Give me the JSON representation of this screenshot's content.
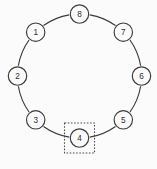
{
  "diagram": {
    "type": "ring-network",
    "background_color": "#fbfbfb",
    "line_color": "#3a3a3a",
    "ring": {
      "center_x": 79.5,
      "center_y": 76,
      "radius": 62,
      "node_radius": 9.2,
      "gap_degrees": 9.5
    },
    "nodes": [
      {
        "id": "node-1",
        "label": "1",
        "angle": 225,
        "cx": 35.7,
        "cy": 32.2,
        "selected": false
      },
      {
        "id": "node-2",
        "label": "2",
        "angle": 180,
        "cx": 17.5,
        "cy": 76.0,
        "selected": false
      },
      {
        "id": "node-3",
        "label": "3",
        "angle": 135,
        "cx": 35.7,
        "cy": 119.8,
        "selected": false
      },
      {
        "id": "node-4",
        "label": "4",
        "angle": 90,
        "cx": 79.5,
        "cy": 138.0,
        "selected": true
      },
      {
        "id": "node-5",
        "label": "5",
        "angle": 45,
        "cx": 123.3,
        "cy": 119.8,
        "selected": false
      },
      {
        "id": "node-6",
        "label": "6",
        "angle": 0,
        "cx": 141.5,
        "cy": 76.0,
        "selected": false
      },
      {
        "id": "node-7",
        "label": "7",
        "angle": 315,
        "cx": 123.3,
        "cy": 32.2,
        "selected": false
      },
      {
        "id": "node-8",
        "label": "8",
        "angle": 270,
        "cx": 79.5,
        "cy": 14.0,
        "selected": false
      }
    ],
    "selection": {
      "target_label": "4",
      "x": 64.5,
      "y": 123.0,
      "width": 30,
      "height": 30,
      "stroke_color": "#4a4a4a",
      "dash_pattern": "1.6 1.6"
    }
  }
}
